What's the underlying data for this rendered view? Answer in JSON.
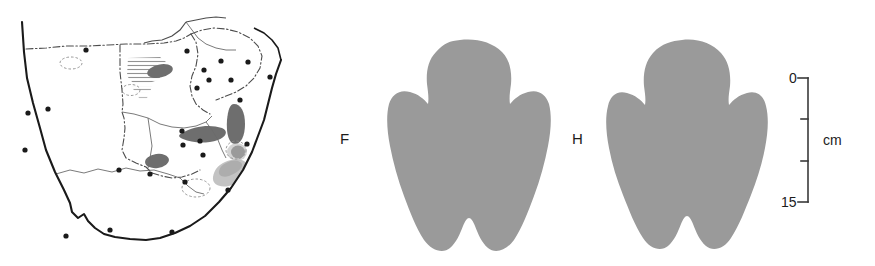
{
  "figure": {
    "panels": [
      {
        "id": "distribution-map",
        "kind": "map"
      },
      {
        "id": "spoor-diagram",
        "kind": "footprints"
      }
    ]
  },
  "map": {
    "region_name": "Southern Africa",
    "colors": {
      "coastline": "#1a1a1a",
      "international_border": "#4d4d4d",
      "range_dark": "#6e6e6e",
      "range_light": "#b8b8b8",
      "locality_dot": "#1a1a1a",
      "land_fill": "#ffffff"
    },
    "locality_dots": [
      {
        "x": 28,
        "y": 113
      },
      {
        "x": 48,
        "y": 109
      },
      {
        "x": 25,
        "y": 150
      },
      {
        "x": 86,
        "y": 50
      },
      {
        "x": 187,
        "y": 51
      },
      {
        "x": 221,
        "y": 61
      },
      {
        "x": 248,
        "y": 62
      },
      {
        "x": 204,
        "y": 70
      },
      {
        "x": 231,
        "y": 80
      },
      {
        "x": 209,
        "y": 80
      },
      {
        "x": 240,
        "y": 100
      },
      {
        "x": 270,
        "y": 77
      },
      {
        "x": 197,
        "y": 88
      },
      {
        "x": 182,
        "y": 131
      },
      {
        "x": 200,
        "y": 141
      },
      {
        "x": 183,
        "y": 145
      },
      {
        "x": 247,
        "y": 144
      },
      {
        "x": 150,
        "y": 174
      },
      {
        "x": 185,
        "y": 182
      },
      {
        "x": 228,
        "y": 190
      },
      {
        "x": 203,
        "y": 155
      },
      {
        "x": 119,
        "y": 170
      },
      {
        "x": 110,
        "y": 230
      },
      {
        "x": 172,
        "y": 232
      },
      {
        "x": 66,
        "y": 236
      }
    ]
  },
  "spoor": {
    "front": {
      "label": "F",
      "meaning": "front foot",
      "fill": "#9a9a9a"
    },
    "hind": {
      "label": "H",
      "meaning": "hind foot",
      "fill": "#9a9a9a"
    }
  },
  "scale_bar": {
    "top_value": "0",
    "bottom_value": "15",
    "unit": "cm",
    "tick_values": [
      "0",
      "5",
      "10",
      "15"
    ],
    "color": "#3a3a3a"
  }
}
